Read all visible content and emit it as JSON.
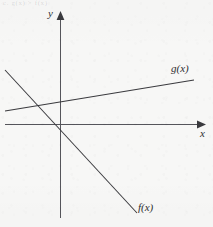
{
  "figure": {
    "name": "linear-functions-graph",
    "background_color": "#f7f7f6",
    "ink_color": "#3a3a3e",
    "width": 213,
    "height": 227,
    "header_fragment": "c. g(x) > f(x)"
  },
  "labels": {
    "y_axis": "y",
    "x_axis": "x",
    "function_g": "g(x)",
    "function_f": "f(x)"
  },
  "chart_data": {
    "type": "line",
    "title": "",
    "subtitle": "",
    "xlabel": "x",
    "ylabel": "y",
    "grid": false,
    "legend": "inline-end-labels",
    "axes": {
      "origin_px": [
        60,
        124
      ],
      "x_axis_px": {
        "x1": 5,
        "y1": 124,
        "x2": 206,
        "y2": 124,
        "arrow": "end"
      },
      "y_axis_px": {
        "x1": 60,
        "y1": 11,
        "x2": 60,
        "y2": 218,
        "arrow": "start"
      },
      "xlim": [
        -1.0,
        3.0
      ],
      "ylim": [
        -2.0,
        2.3
      ],
      "ticks": [],
      "tick_labels": []
    },
    "series": [
      {
        "name": "g(x)",
        "label": "g(x)",
        "color": "#3a3a3e",
        "style": "solid",
        "slope_sign": "positive",
        "description": "gently rising line with positive y-intercept",
        "points_px": [
          [
            5,
            111
          ],
          [
            194,
            80
          ]
        ],
        "y_intercept_px": [
          60,
          102
        ],
        "x_intercept_px": [
          -670,
          124
        ],
        "points": [
          [
            -1.0,
            0.24
          ],
          [
            2.78,
            0.8
          ]
        ],
        "y_intercept": 0.4,
        "slope": 0.15
      },
      {
        "name": "f(x)",
        "label": "f(x)",
        "color": "#3a3a3e",
        "style": "solid",
        "slope_sign": "negative",
        "description": "steeply falling line crossing near the origin",
        "points_px": [
          [
            5,
            70
          ],
          [
            137,
            213
          ]
        ],
        "y_intercept_px": [
          60,
          130
        ],
        "x_intercept_px": [
          54,
          124
        ],
        "points": [
          [
            -1.0,
            1.04
          ],
          [
            1.64,
            -1.72
          ]
        ],
        "y_intercept": -0.12,
        "slope": -1.08
      }
    ],
    "annotations": [
      {
        "text": "g(x)",
        "at_px": [
          171,
          63
        ],
        "anchor": "start"
      },
      {
        "text": "f(x)",
        "at_px": [
          138,
          202
        ],
        "anchor": "start"
      },
      {
        "text": "y",
        "at_px": [
          48,
          8
        ],
        "anchor": "start"
      },
      {
        "text": "x",
        "at_px": [
          200,
          128
        ],
        "anchor": "start"
      }
    ],
    "intersections": [
      {
        "series": [
          "f(x)",
          "g(x)"
        ],
        "at_px": [
          57,
          126
        ],
        "approx": [
          -0.06,
          -0.19
        ]
      }
    ]
  }
}
